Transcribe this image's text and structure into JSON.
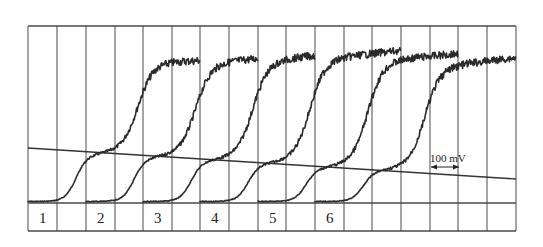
{
  "chart_data": {
    "type": "line",
    "title": "",
    "xlabel": "",
    "ylabel": "",
    "grid": true,
    "x_units_per_division": "100 mV",
    "scale_bar": {
      "label": "100 mV",
      "divisions": 1
    },
    "frame": {
      "left": 28,
      "top": 26,
      "right": 516,
      "bottom": 231
    },
    "vertical_grid_x": [
      28,
      57,
      86,
      115,
      143,
      172,
      200,
      229,
      258,
      286,
      315,
      344,
      372,
      401,
      430,
      458,
      487,
      516
    ],
    "baseline_y": 203,
    "label_row": {
      "top": 203,
      "bottom": 231
    },
    "sloping_line": {
      "x1": 28,
      "y1": 148,
      "x2": 516,
      "y2": 179
    },
    "series": [
      {
        "name": "1",
        "start_x": 28,
        "shoulder_x": 88,
        "shoulder_y": 157,
        "rise_x": 138,
        "plateau_y": 64,
        "end_x": 200,
        "end_y": 62
      },
      {
        "name": "2",
        "start_x": 86,
        "shoulder_x": 146,
        "shoulder_y": 160,
        "rise_x": 196,
        "plateau_y": 64,
        "end_x": 258,
        "end_y": 60
      },
      {
        "name": "3",
        "start_x": 143,
        "shoulder_x": 203,
        "shoulder_y": 163,
        "rise_x": 253,
        "plateau_y": 62,
        "end_x": 315,
        "end_y": 57
      },
      {
        "name": "4",
        "start_x": 200,
        "shoulder_x": 260,
        "shoulder_y": 166,
        "rise_x": 310,
        "plateau_y": 60,
        "end_x": 401,
        "end_y": 52
      },
      {
        "name": "5",
        "start_x": 258,
        "shoulder_x": 318,
        "shoulder_y": 170,
        "rise_x": 368,
        "plateau_y": 62,
        "end_x": 458,
        "end_y": 55
      },
      {
        "name": "6",
        "start_x": 315,
        "shoulder_x": 375,
        "shoulder_y": 173,
        "rise_x": 425,
        "plateau_y": 68,
        "end_x": 516,
        "end_y": 59
      }
    ],
    "labels": [
      "1",
      "2",
      "3",
      "4",
      "5",
      "6"
    ]
  }
}
